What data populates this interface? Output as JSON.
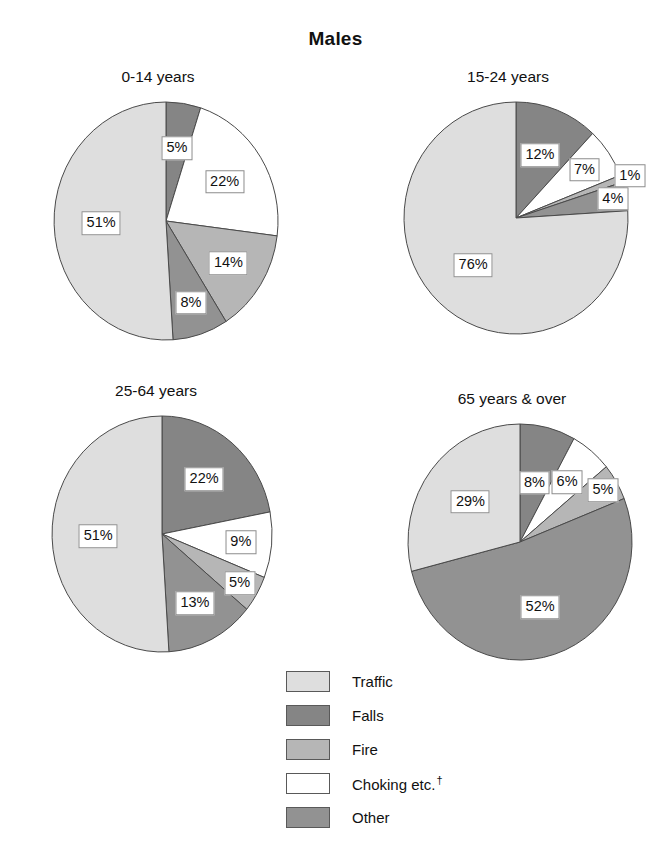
{
  "header": {
    "title": "Males"
  },
  "legend": {
    "position": "bottom-center",
    "items": [
      {
        "label": "Traffic",
        "color": "#dedede"
      },
      {
        "label": "Falls",
        "color": "#858585"
      },
      {
        "label": "Fire",
        "color": "#b6b6b6"
      },
      {
        "label": "Choking etc.",
        "dagger": "†",
        "color": "#ffffff"
      },
      {
        "label": "Other",
        "color": "#929292"
      }
    ]
  },
  "chart_data": {
    "type": "pie",
    "title": "Males",
    "footnote_marker": "†",
    "categories": [
      "Traffic",
      "Falls",
      "Fire",
      "Choking etc.",
      "Other"
    ],
    "colors": {
      "Traffic": "#dedede",
      "Falls": "#858585",
      "Fire": "#b6b6b6",
      "Choking etc.": "#ffffff",
      "Other": "#929292"
    },
    "unit": "%",
    "charts": [
      {
        "title": "0-14 years",
        "slice_order": [
          "Falls",
          "Choking etc.",
          "Fire",
          "Other",
          "Traffic"
        ],
        "values": {
          "Falls": 5,
          "Choking etc.": 22,
          "Fire": 14,
          "Other": 8,
          "Traffic": 51
        },
        "labels": [
          "5%",
          "22%",
          "14%",
          "8%",
          "51%"
        ]
      },
      {
        "title": "15-24 years",
        "slice_order": [
          "Falls",
          "Choking etc.",
          "Fire",
          "Other",
          "Traffic"
        ],
        "values": {
          "Falls": 12,
          "Choking etc.": 7,
          "Fire": 1,
          "Other": 4,
          "Traffic": 76
        },
        "labels": [
          "12%",
          "7%",
          "1%",
          "4%",
          "76%"
        ]
      },
      {
        "title": "25-64 years",
        "slice_order": [
          "Falls",
          "Choking etc.",
          "Fire",
          "Other",
          "Traffic"
        ],
        "values": {
          "Falls": 22,
          "Choking etc.": 9,
          "Fire": 5,
          "Other": 13,
          "Traffic": 51
        },
        "labels": [
          "22%",
          "9%",
          "5%",
          "13%",
          "51%"
        ]
      },
      {
        "title": "65 years & over",
        "slice_order": [
          "Falls",
          "Choking etc.",
          "Fire",
          "Other",
          "Traffic"
        ],
        "values": {
          "Falls": 8,
          "Choking etc.": 6,
          "Fire": 5,
          "Other": 52,
          "Traffic": 29
        },
        "labels": [
          "8%",
          "6%",
          "5%",
          "52%",
          "29%"
        ]
      }
    ]
  },
  "panels": {
    "p0": {
      "title": "0-14 years",
      "l0": "5%",
      "l1": "22%",
      "l2": "14%",
      "l3": "8%",
      "l4": "51%"
    },
    "p1": {
      "title": "15-24 years",
      "l0": "12%",
      "l1": "7%",
      "l2": "1%",
      "l3": "4%",
      "l4": "76%"
    },
    "p2": {
      "title": "25-64 years",
      "l0": "22%",
      "l1": "9%",
      "l2": "5%",
      "l3": "13%",
      "l4": "51%"
    },
    "p3": {
      "title": "65 years & over",
      "l0": "8%",
      "l1": "6%",
      "l2": "5%",
      "l3": "52%",
      "l4": "29%"
    }
  }
}
